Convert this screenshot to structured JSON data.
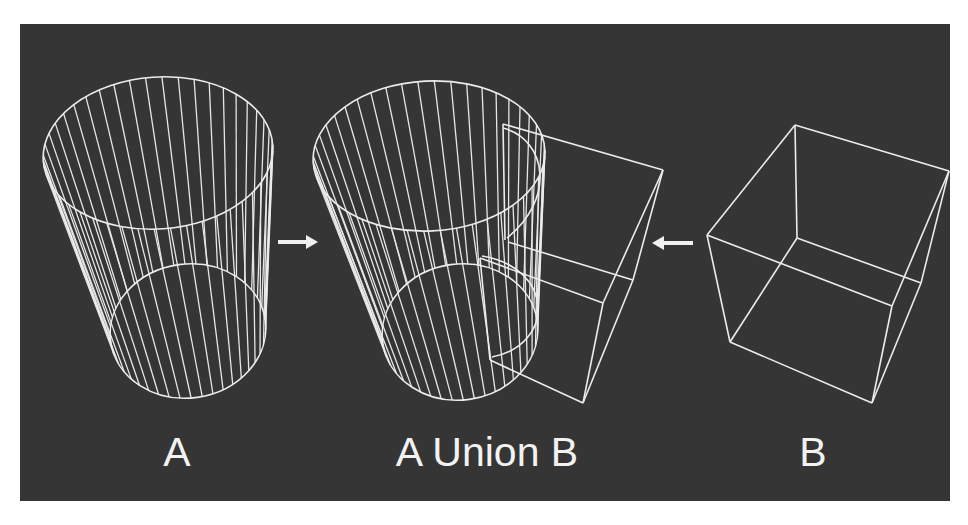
{
  "figure": {
    "background": "#353535",
    "line_color": "#ececec",
    "labels": [
      {
        "id": "a",
        "text": "A",
        "x": 177,
        "y": 432
      },
      {
        "id": "union",
        "text": "A Union B",
        "x": 487,
        "y": 432
      },
      {
        "id": "b",
        "text": "B",
        "x": 813,
        "y": 432
      }
    ],
    "arrows": [
      {
        "id": "arrow-right",
        "direction": "right",
        "x1": 278,
        "x2": 318,
        "y": 242
      },
      {
        "id": "arrow-left",
        "direction": "left",
        "x1": 693,
        "x2": 652,
        "y": 243
      }
    ],
    "cylinder_a": {
      "top": {
        "cx": 158,
        "cy": 153,
        "rx": 115,
        "ry": 76,
        "rot": -4
      },
      "bottom": {
        "cx": 188,
        "cy": 331,
        "rx": 78,
        "ry": 67,
        "rot": -8
      },
      "hatch_count": 44
    },
    "cylinder_union": {
      "top": {
        "cx": 429,
        "cy": 156,
        "rx": 116,
        "ry": 75,
        "rot": -3
      },
      "bottom": {
        "cx": 460,
        "cy": 332,
        "rx": 78,
        "ry": 68,
        "rot": -8
      },
      "hatch_count": 44
    },
    "cube_b": {
      "edges": [
        [
          [
            795,
            125
          ],
          [
            949,
            171
          ]
        ],
        [
          [
            795,
            125
          ],
          [
            707,
            235
          ]
        ],
        [
          [
            795,
            125
          ],
          [
            797,
            238
          ]
        ],
        [
          [
            707,
            235
          ],
          [
            892,
            306
          ]
        ],
        [
          [
            707,
            235
          ],
          [
            730,
            342
          ]
        ],
        [
          [
            797,
            238
          ],
          [
            921,
            283
          ]
        ],
        [
          [
            797,
            238
          ],
          [
            730,
            342
          ]
        ],
        [
          [
            730,
            342
          ],
          [
            872,
            403
          ]
        ],
        [
          [
            872,
            403
          ],
          [
            892,
            306
          ]
        ],
        [
          [
            892,
            306
          ],
          [
            949,
            171
          ]
        ],
        [
          [
            872,
            403
          ],
          [
            921,
            283
          ]
        ],
        [
          [
            921,
            283
          ],
          [
            949,
            171
          ]
        ]
      ]
    },
    "union_box": {
      "edges": [
        [
          [
            503,
            124
          ],
          [
            663,
            170
          ]
        ],
        [
          [
            503,
            124
          ],
          [
            505,
            240
          ]
        ],
        [
          [
            663,
            170
          ],
          [
            603,
            303
          ]
        ],
        [
          [
            663,
            170
          ],
          [
            633,
            280
          ]
        ],
        [
          [
            508,
            242
          ],
          [
            633,
            280
          ]
        ],
        [
          [
            480,
            258
          ],
          [
            603,
            303
          ]
        ],
        [
          [
            480,
            258
          ],
          [
            490,
            360
          ]
        ],
        [
          [
            490,
            360
          ],
          [
            583,
            403
          ]
        ],
        [
          [
            603,
            303
          ],
          [
            583,
            403
          ]
        ],
        [
          [
            633,
            280
          ],
          [
            583,
            403
          ]
        ]
      ],
      "cut_curves": [
        "M503,128 C548,140 555,200 507,238",
        "M482,256 C555,268 555,345 492,357"
      ]
    }
  }
}
